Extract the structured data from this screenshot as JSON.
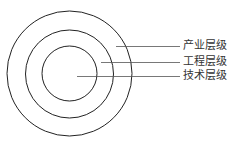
{
  "diagram": {
    "type": "concentric-circles",
    "center": {
      "x": 69.5,
      "y": 73.5
    },
    "circles": [
      {
        "name": "outer",
        "r": 62.5
      },
      {
        "name": "middle",
        "r": 44
      },
      {
        "name": "inner",
        "r": 27.5
      }
    ],
    "labels": [
      {
        "text": "产业层级",
        "line_y": 46,
        "line_x1": 116
      },
      {
        "text": "工程层级",
        "line_y": 62,
        "line_x1": 101
      },
      {
        "text": "技术层级",
        "line_y": 76,
        "line_x1": 77
      }
    ],
    "line_x2": 180,
    "colors": {
      "circle": "#222222",
      "leader": "#555555",
      "text": "#333333"
    }
  }
}
